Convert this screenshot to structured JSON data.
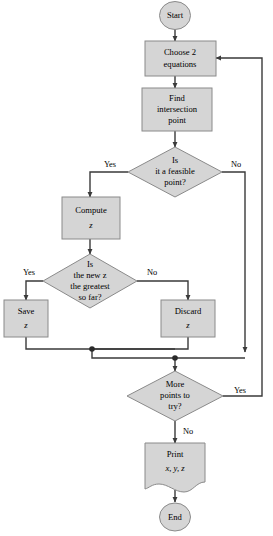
{
  "diagram": {
    "colors": {
      "node_fill": "#d5d5d5",
      "node_stroke": "#8a8a8a",
      "connector": "#3a3a3a",
      "background": "#ffffff",
      "text": "#000000"
    },
    "nodes": [
      {
        "id": "start",
        "type": "terminator",
        "lines": [
          "Start"
        ],
        "italic_lines": []
      },
      {
        "id": "choose-equations",
        "type": "process",
        "lines": [
          "Choose 2",
          "equations"
        ],
        "italic_lines": []
      },
      {
        "id": "find-intersection",
        "type": "process",
        "lines": [
          "Find",
          "intersection",
          "point"
        ],
        "italic_lines": []
      },
      {
        "id": "feasible-decision",
        "type": "decision",
        "lines": [
          "Is",
          "it a feasible",
          "point?"
        ],
        "italic_lines": []
      },
      {
        "id": "compute-z",
        "type": "process",
        "lines": [
          "Compute",
          "z"
        ],
        "italic_lines": [
          "z"
        ]
      },
      {
        "id": "greatest-decision",
        "type": "decision",
        "lines": [
          "Is",
          "the new z",
          "the greatest",
          "so far?"
        ],
        "italic_lines": []
      },
      {
        "id": "save-z",
        "type": "process",
        "lines": [
          "Save",
          "z"
        ],
        "italic_lines": [
          "z"
        ]
      },
      {
        "id": "discard-z",
        "type": "process",
        "lines": [
          "Discard",
          "z"
        ],
        "italic_lines": [
          "z"
        ]
      },
      {
        "id": "more-points-decision",
        "type": "decision",
        "lines": [
          "More",
          "points to",
          "try?"
        ],
        "italic_lines": []
      },
      {
        "id": "print-output",
        "type": "document",
        "lines": [
          "Print",
          "x, y, z"
        ],
        "italic_lines": [
          "x, y, z"
        ]
      },
      {
        "id": "end",
        "type": "terminator",
        "lines": [
          "End"
        ],
        "italic_lines": []
      }
    ],
    "labels": {
      "start": "Start",
      "choose_line1": "Choose 2",
      "choose_line2": "equations",
      "find_line1": "Find",
      "find_line2": "intersection",
      "find_line3": "point",
      "feasible_line1": "Is",
      "feasible_line2": "it a feasible",
      "feasible_line3": "point?",
      "compute_line1": "Compute",
      "compute_line2": "z",
      "greatest_line1": "Is",
      "greatest_line2": "the new z",
      "greatest_line3": "the greatest",
      "greatest_line4": "so far?",
      "save_line1": "Save",
      "save_line2": "z",
      "discard_line1": "Discard",
      "discard_line2": "z",
      "more_line1": "More",
      "more_line2": "points to",
      "more_line3": "try?",
      "print_line1": "Print",
      "print_line2": "x, y, z",
      "end": "End"
    },
    "edge_labels": {
      "feasible_yes": "Yes",
      "feasible_no": "No",
      "greatest_yes": "Yes",
      "greatest_no": "No",
      "more_yes": "Yes",
      "more_no": "No"
    }
  }
}
